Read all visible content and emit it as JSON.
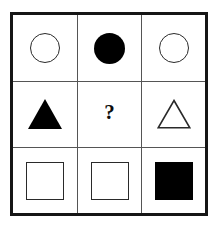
{
  "puzzle": {
    "type": "matrix-reasoning",
    "grid_rows": 3,
    "grid_columns": 3,
    "missing_cell": {
      "row": 2,
      "column": 2
    },
    "missing_marker": "?",
    "colors": {
      "background": "#ffffff",
      "outer_border": "#161616",
      "inner_divider": "#555555",
      "shape_fill": "#000000",
      "shape_stroke": "#2a2a2a",
      "marker_text": "#0d0d0d"
    },
    "cells": [
      {
        "id": "cell-r1c1",
        "row": 1,
        "column": 1,
        "shape": "circle",
        "fill": "outline",
        "icon": "circle-outline-icon"
      },
      {
        "id": "cell-r1c2",
        "row": 1,
        "column": 2,
        "shape": "circle",
        "fill": "filled",
        "icon": "circle-filled-icon"
      },
      {
        "id": "cell-r1c3",
        "row": 1,
        "column": 3,
        "shape": "circle",
        "fill": "outline",
        "icon": "circle-outline-icon"
      },
      {
        "id": "cell-r2c1",
        "row": 2,
        "column": 1,
        "shape": "triangle",
        "fill": "filled",
        "icon": "triangle-filled-icon"
      },
      {
        "id": "cell-r2c2",
        "row": 2,
        "column": 2,
        "shape": "question-mark",
        "fill": "none",
        "icon": "question-mark-icon",
        "label": "?"
      },
      {
        "id": "cell-r2c3",
        "row": 2,
        "column": 3,
        "shape": "triangle",
        "fill": "outline",
        "icon": "triangle-outline-icon"
      },
      {
        "id": "cell-r3c1",
        "row": 3,
        "column": 1,
        "shape": "square",
        "fill": "outline",
        "icon": "square-outline-icon"
      },
      {
        "id": "cell-r3c2",
        "row": 3,
        "column": 2,
        "shape": "square",
        "fill": "outline",
        "icon": "square-outline-icon"
      },
      {
        "id": "cell-r3c3",
        "row": 3,
        "column": 3,
        "shape": "square",
        "fill": "filled",
        "icon": "square-filled-icon"
      }
    ]
  }
}
